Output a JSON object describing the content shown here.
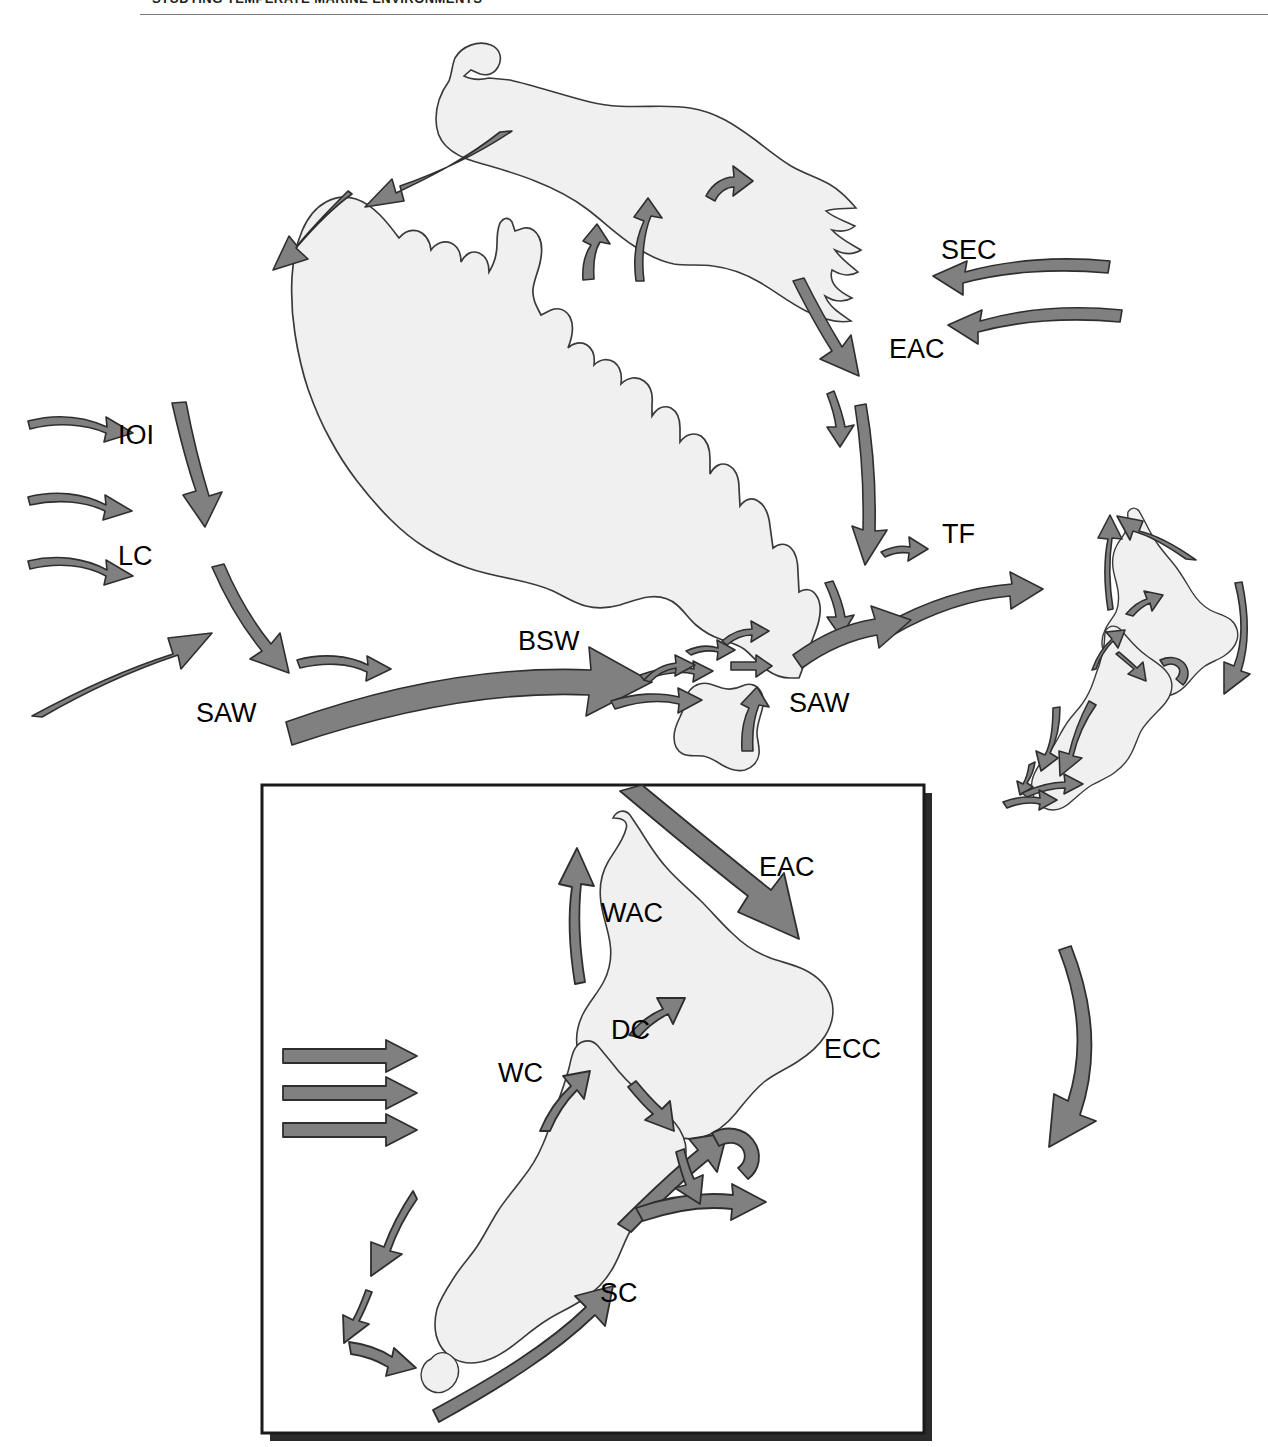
{
  "header": {
    "running_head": "STUDYING TEMPERATE MARINE ENVIRONMENTS"
  },
  "figure": {
    "type": "schematic-map",
    "land_fill": "#f0f0f0",
    "land_stroke": "#3a3a3a",
    "arrow_fill": "#808080",
    "arrow_stroke": "#2e2e2e",
    "panel_border": "#1a1a1a",
    "panel_shadow": "#2b2b2b"
  },
  "main_map": {
    "name": "australia-new-zealand-currents",
    "landmasses": [
      "New Guinea",
      "Australia",
      "Tasmania",
      "New Zealand North Island",
      "New Zealand South Island",
      "Stewart Island"
    ],
    "labels": [
      {
        "id": "ioi",
        "text": "IOI",
        "x": 118,
        "y": 422,
        "meaning": "Indian Ocean Inflow"
      },
      {
        "id": "lc",
        "text": "LC",
        "x": 118,
        "y": 543,
        "meaning": "Leeuwin Current"
      },
      {
        "id": "saw-w",
        "text": "SAW",
        "x": 196,
        "y": 700,
        "meaning": "Subantarctic Water"
      },
      {
        "id": "bsw",
        "text": "BSW",
        "x": 518,
        "y": 628,
        "meaning": "Bass Strait Water"
      },
      {
        "id": "saw-e",
        "text": "SAW",
        "x": 789,
        "y": 690,
        "meaning": "Subantarctic Water"
      },
      {
        "id": "sec",
        "text": "SEC",
        "x": 941,
        "y": 237,
        "meaning": "South Equatorial Current"
      },
      {
        "id": "eac",
        "text": "EAC",
        "x": 889,
        "y": 336,
        "meaning": "East Australian Current"
      },
      {
        "id": "tf",
        "text": "TF",
        "x": 942,
        "y": 521,
        "meaning": "Tasman Front"
      }
    ]
  },
  "inset_map": {
    "name": "new-zealand-currents-inset",
    "labels": [
      {
        "id": "eac-inset",
        "text": "EAC",
        "x": 759,
        "y": 854,
        "meaning": "East Australian Current"
      },
      {
        "id": "wac",
        "text": "WAC",
        "x": 601,
        "y": 900,
        "meaning": "West Auckland Current"
      },
      {
        "id": "dc",
        "text": "DC",
        "x": 611,
        "y": 1017,
        "meaning": "D'Urville Current"
      },
      {
        "id": "ecc",
        "text": "ECC",
        "x": 824,
        "y": 1036,
        "meaning": "East Cape Current"
      },
      {
        "id": "wc",
        "text": "WC",
        "x": 498,
        "y": 1060,
        "meaning": "Westland Current"
      },
      {
        "id": "sc",
        "text": "SC",
        "x": 600,
        "y": 1280,
        "meaning": "Southland Current"
      }
    ]
  }
}
